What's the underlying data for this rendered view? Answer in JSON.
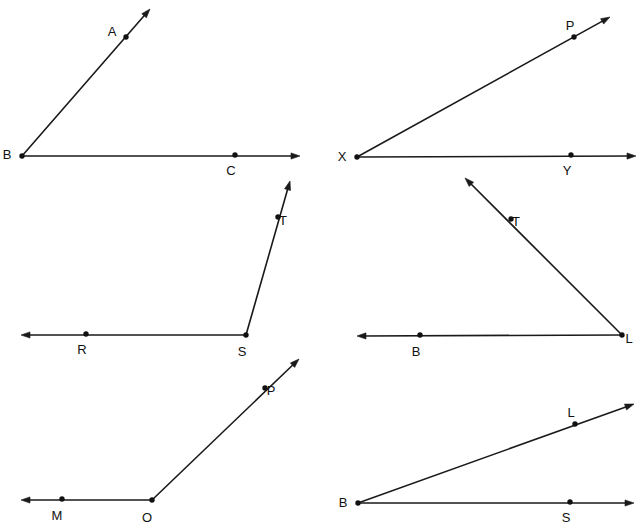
{
  "canvas": {
    "width": 640,
    "height": 528,
    "background": "#ffffff",
    "ink_color": "#1a1a1a",
    "label_color": "#111111"
  },
  "figures": [
    {
      "id": "angle-abc",
      "name": "angle-abc-figure",
      "vertex_label": "B",
      "rays": [
        {
          "name": "ray-ba",
          "from": {
            "x": 22,
            "y": 156
          },
          "to": {
            "x": 150,
            "y": 9
          },
          "arrow_at_end": true
        },
        {
          "name": "ray-bc",
          "from": {
            "x": 22,
            "y": 156
          },
          "to": {
            "x": 300,
            "y": 156
          },
          "arrow_at_end": true
        }
      ],
      "points": [
        {
          "label": "A",
          "x": 126,
          "y": 37,
          "label_dx": -14,
          "label_dy": -4
        },
        {
          "label": "B",
          "x": 22,
          "y": 156,
          "label_dx": -15,
          "label_dy": 0
        },
        {
          "label": "C",
          "x": 235,
          "y": 155,
          "label_dx": -4,
          "label_dy": 17
        }
      ]
    },
    {
      "id": "angle-pxy",
      "name": "angle-pxy-figure",
      "vertex_label": "X",
      "rays": [
        {
          "name": "ray-xp",
          "from": {
            "x": 357,
            "y": 157
          },
          "to": {
            "x": 610,
            "y": 17
          },
          "arrow_at_end": true
        },
        {
          "name": "ray-xy",
          "from": {
            "x": 357,
            "y": 157
          },
          "to": {
            "x": 636,
            "y": 156
          },
          "arrow_at_end": true
        }
      ],
      "points": [
        {
          "label": "P",
          "x": 574,
          "y": 37,
          "label_dx": -4,
          "label_dy": -10
        },
        {
          "label": "X",
          "x": 357,
          "y": 157,
          "label_dx": -15,
          "label_dy": 1
        },
        {
          "label": "Y",
          "x": 571,
          "y": 155,
          "label_dx": -4,
          "label_dy": 17
        }
      ]
    },
    {
      "id": "angle-rst",
      "name": "angle-rst-figure",
      "vertex_label": "S",
      "rays": [
        {
          "name": "ray-st",
          "from": {
            "x": 246,
            "y": 335
          },
          "to": {
            "x": 290,
            "y": 181
          },
          "arrow_at_end": true
        },
        {
          "name": "ray-sr",
          "from": {
            "x": 246,
            "y": 335
          },
          "to": {
            "x": 21,
            "y": 335
          },
          "arrow_at_end": true
        }
      ],
      "points": [
        {
          "label": "T",
          "x": 278,
          "y": 217,
          "label_dx": 5,
          "label_dy": 5
        },
        {
          "label": "R",
          "x": 86,
          "y": 334,
          "label_dx": -4,
          "label_dy": 17
        },
        {
          "label": "S",
          "x": 246,
          "y": 335,
          "label_dx": -4,
          "label_dy": 18
        }
      ]
    },
    {
      "id": "angle-tlb",
      "name": "angle-tlb-figure",
      "vertex_label": "L",
      "rays": [
        {
          "name": "ray-lt",
          "from": {
            "x": 622,
            "y": 335
          },
          "to": {
            "x": 465,
            "y": 178
          },
          "arrow_at_end": true
        },
        {
          "name": "ray-lb",
          "from": {
            "x": 622,
            "y": 335
          },
          "to": {
            "x": 357,
            "y": 336
          },
          "arrow_at_end": true
        }
      ],
      "points": [
        {
          "label": "T",
          "x": 511,
          "y": 219,
          "label_dx": 5,
          "label_dy": 4
        },
        {
          "label": "B",
          "x": 420,
          "y": 335,
          "label_dx": -4,
          "label_dy": 18
        },
        {
          "label": "L",
          "x": 622,
          "y": 335,
          "label_dx": 7,
          "label_dy": 5
        }
      ]
    },
    {
      "id": "angle-mop",
      "name": "angle-mop-figure",
      "vertex_label": "O",
      "rays": [
        {
          "name": "ray-op",
          "from": {
            "x": 152,
            "y": 500
          },
          "to": {
            "x": 299,
            "y": 359
          },
          "arrow_at_end": true
        },
        {
          "name": "ray-om",
          "from": {
            "x": 152,
            "y": 500
          },
          "to": {
            "x": 21,
            "y": 500
          },
          "arrow_at_end": true
        }
      ],
      "points": [
        {
          "label": "P",
          "x": 265,
          "y": 388,
          "label_dx": 6,
          "label_dy": 4
        },
        {
          "label": "M",
          "x": 62,
          "y": 499,
          "label_dx": -5,
          "label_dy": 18
        },
        {
          "label": "O",
          "x": 152,
          "y": 500,
          "label_dx": -5,
          "label_dy": 19
        }
      ]
    },
    {
      "id": "angle-lbs",
      "name": "angle-lbs-figure",
      "vertex_label": "B",
      "rays": [
        {
          "name": "ray-bl",
          "from": {
            "x": 358,
            "y": 503
          },
          "to": {
            "x": 634,
            "y": 404
          },
          "arrow_at_end": true
        },
        {
          "name": "ray-bs",
          "from": {
            "x": 358,
            "y": 503
          },
          "to": {
            "x": 634,
            "y": 503
          },
          "arrow_at_end": true
        }
      ],
      "points": [
        {
          "label": "L",
          "x": 575,
          "y": 424,
          "label_dx": -4,
          "label_dy": -10
        },
        {
          "label": "B",
          "x": 358,
          "y": 503,
          "label_dx": -15,
          "label_dy": 1
        },
        {
          "label": "S",
          "x": 570,
          "y": 502,
          "label_dx": -4,
          "label_dy": 17
        }
      ]
    }
  ]
}
